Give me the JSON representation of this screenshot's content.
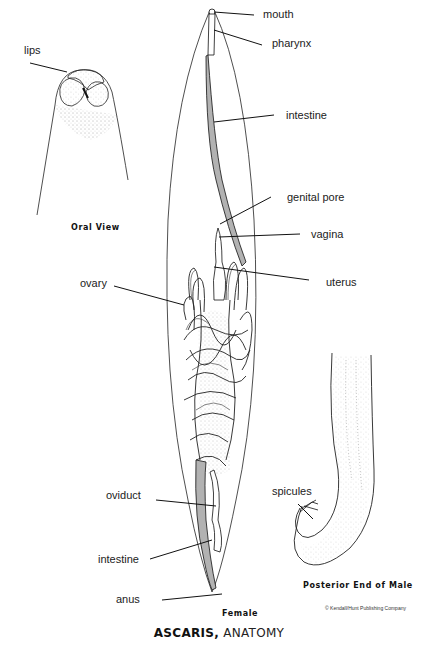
{
  "title": {
    "bold": "ASCARIS,",
    "regular": "ANATOMY"
  },
  "views": {
    "oral_view": {
      "caption": "Oral View",
      "labels": {
        "lips": "lips"
      }
    },
    "female": {
      "caption": "Female",
      "labels": {
        "mouth": "mouth",
        "pharynx": "pharynx",
        "intestine_upper": "intestine",
        "genital_pore": "genital pore",
        "vagina": "vagina",
        "uterus": "uterus",
        "ovary": "ovary",
        "oviduct": "oviduct",
        "intestine_lower": "intestine",
        "anus": "anus"
      }
    },
    "male_posterior": {
      "caption": "Posterior End of Male",
      "labels": {
        "spicules": "spicules"
      }
    }
  },
  "copyright": "© Kendall/Hunt Publishing Company",
  "colors": {
    "background": "#ffffff",
    "ink": "#111111",
    "label_text": "#222222"
  }
}
